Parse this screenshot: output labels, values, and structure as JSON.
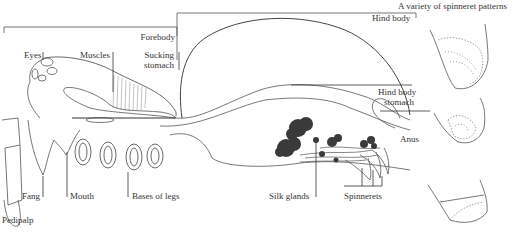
{
  "title": "A variety of spinneret patterns",
  "colors": {
    "line": "#555555",
    "text": "#333333",
    "gland": "#3a3a3a"
  },
  "labels": {
    "forebody": "Forebody",
    "hind_body": "Hind body",
    "eyes": "Eyes",
    "muscles": "Muscles",
    "sucking_stomach_1": "Sucking",
    "sucking_stomach_2": "stomach",
    "hind_body_stomach_1": "Hind body",
    "hind_body_stomach_2": "stomach",
    "anus": "Anus",
    "fang": "Fang",
    "mouth": "Mouth",
    "bases_of_legs": "Bases of legs",
    "silk_glands": "Silk glands",
    "spinnerets": "Spinnerets",
    "pedipalp": "Pedipalp"
  }
}
